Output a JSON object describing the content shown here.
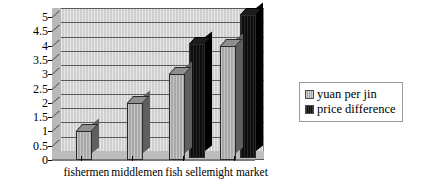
{
  "chart_data": {
    "type": "bar",
    "title": "",
    "subtitle": "",
    "xlabel": "",
    "ylabel": "",
    "categories": [
      "fishermen",
      "middlemen",
      "fish seller",
      "night market"
    ],
    "series": [
      {
        "name": "yuan per jin",
        "color": "#a8a8a8",
        "values": [
          1,
          2,
          3,
          4
        ]
      },
      {
        "name": "price difference",
        "color": "#0d0d0d",
        "values": [
          null,
          null,
          4,
          5
        ]
      }
    ],
    "ylim": [
      0,
      5
    ],
    "ytick_labels": [
      "0",
      "0.5",
      "1",
      "1.5",
      "2",
      "2.5",
      "3",
      "3.5",
      "4",
      "4.5",
      "5"
    ],
    "ytick_values": [
      0,
      0.5,
      1,
      1.5,
      2,
      2.5,
      3,
      3.5,
      4,
      4.5,
      5
    ],
    "grid": true,
    "legend_position": "right",
    "style": "3d-clustered-column",
    "plot_background": "#cfcfcf"
  },
  "legend": {
    "entries": [
      {
        "label": "yuan per jin",
        "swatch": "series-gray"
      },
      {
        "label": "price difference",
        "swatch": "series-black"
      }
    ]
  }
}
